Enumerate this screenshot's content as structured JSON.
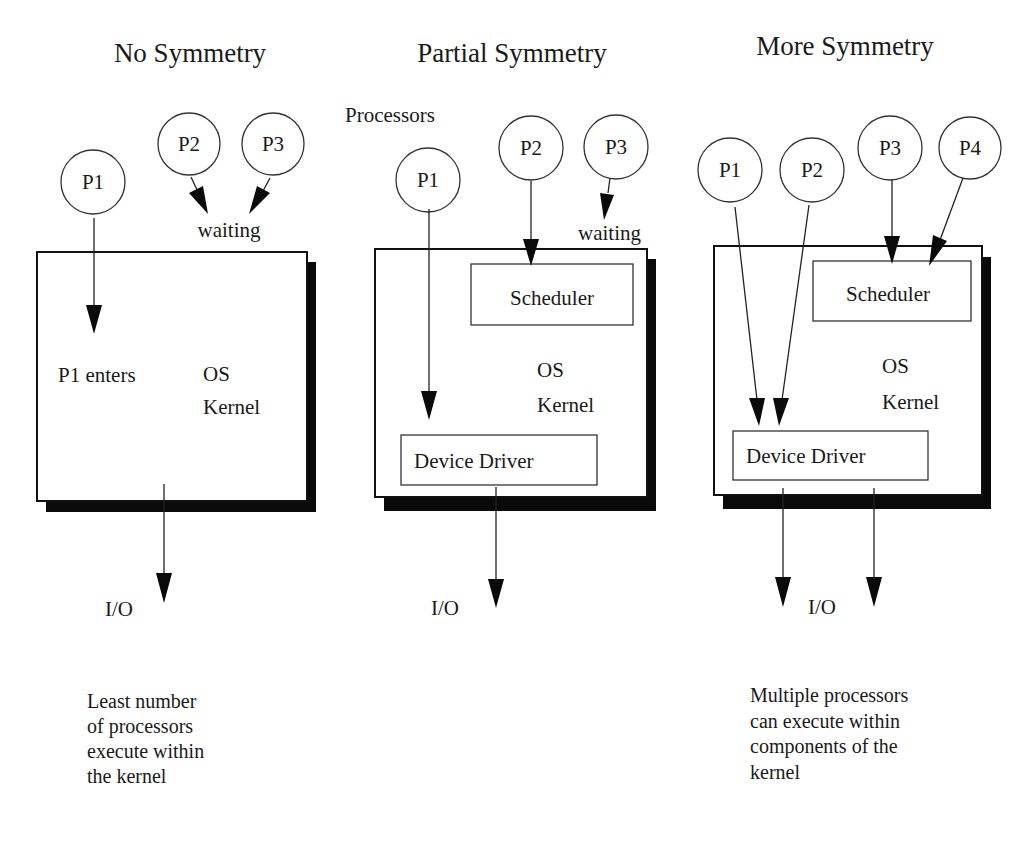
{
  "panels": [
    {
      "id": "no-symmetry",
      "title": "No Symmetry",
      "processors": [
        "P1",
        "P2",
        "P3"
      ],
      "waiting_label": "waiting",
      "enter_label": "P1 enters",
      "kernel_label": [
        "OS",
        "Kernel"
      ],
      "io_label": "I/O",
      "description": [
        "Least number",
        "of processors",
        "execute within",
        "the kernel"
      ]
    },
    {
      "id": "partial-symmetry",
      "title": "Partial Symmetry",
      "group_label": "Processors",
      "processors": [
        "P1",
        "P2",
        "P3"
      ],
      "waiting_label": "waiting",
      "scheduler_label": "Scheduler",
      "kernel_label": [
        "OS",
        "Kernel"
      ],
      "driver_label": "Device Driver",
      "io_label": "I/O"
    },
    {
      "id": "more-symmetry",
      "title": "More Symmetry",
      "processors": [
        "P1",
        "P2",
        "P3",
        "P4"
      ],
      "scheduler_label": "Scheduler",
      "kernel_label": [
        "OS",
        "Kernel"
      ],
      "driver_label": "Device Driver",
      "io_label": "I/O",
      "description": [
        "Multiple processors",
        "can execute within",
        "components of the",
        "kernel"
      ]
    }
  ]
}
